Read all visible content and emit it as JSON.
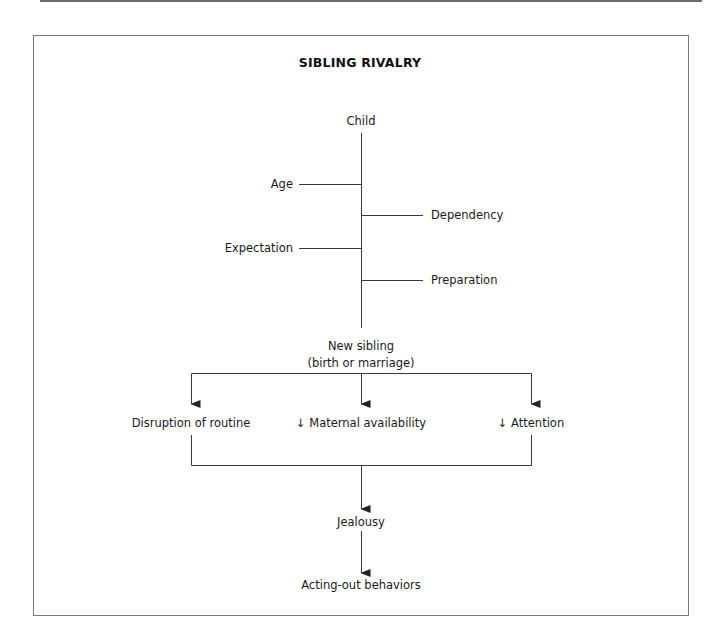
{
  "diagram": {
    "title": "SIBLING RIVALRY",
    "colors": {
      "line": "#3a3a3a",
      "frame": "#7a7a7a",
      "text": "#1a1a1a",
      "background": "#ffffff"
    },
    "root": {
      "label": "Child"
    },
    "influencing_factors": {
      "left": [
        {
          "label": "Age"
        },
        {
          "label": "Expectation"
        }
      ],
      "right": [
        {
          "label": "Dependency"
        },
        {
          "label": "Preparation"
        }
      ]
    },
    "trigger": {
      "line1": "New sibling",
      "line2": "(birth or marriage)"
    },
    "effects": [
      {
        "label": "Disruption of routine"
      },
      {
        "label": "↓ Maternal availability"
      },
      {
        "label": "↓ Attention"
      }
    ],
    "outcome": {
      "label": "Jealousy"
    },
    "result": {
      "label": "Acting-out behaviors"
    }
  }
}
